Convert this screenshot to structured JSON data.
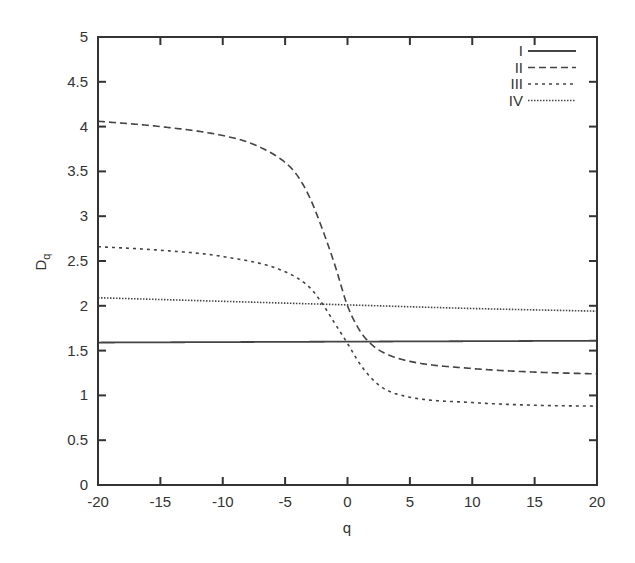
{
  "chart_data": {
    "type": "line",
    "title": "",
    "xlabel": "q",
    "ylabel": "D",
    "ylabel_subscript": "q",
    "xlim": [
      -20,
      20
    ],
    "ylim": [
      0,
      5
    ],
    "xticks": [
      "-20",
      "-15",
      "-10",
      "-5",
      "0",
      "5",
      "10",
      "15",
      "20"
    ],
    "yticks": [
      "0",
      "0.5",
      "1",
      "1.5",
      "2",
      "2.5",
      "3",
      "3.5",
      "4",
      "4.5",
      "5"
    ],
    "grid": false,
    "legend_position": "top-right",
    "series": [
      {
        "name": "I",
        "style": "solid",
        "x": [
          -20,
          20
        ],
        "values": [
          1.59,
          1.61
        ]
      },
      {
        "name": "II",
        "style": "dashed",
        "x": [
          -20,
          -15,
          -10,
          -7.5,
          -5,
          -4,
          -3,
          -2,
          -1,
          0,
          1,
          2,
          3,
          5,
          10,
          15,
          20
        ],
        "values": [
          4.06,
          4.0,
          3.9,
          3.8,
          3.6,
          3.45,
          3.2,
          2.85,
          2.45,
          2.0,
          1.72,
          1.56,
          1.47,
          1.38,
          1.3,
          1.26,
          1.24
        ]
      },
      {
        "name": "III",
        "style": "short-dashed",
        "x": [
          -20,
          -15,
          -10,
          -5,
          -3,
          -2,
          -1,
          0,
          1,
          2,
          3,
          5,
          10,
          15,
          20
        ],
        "values": [
          2.66,
          2.62,
          2.55,
          2.38,
          2.2,
          2.02,
          1.8,
          1.58,
          1.35,
          1.18,
          1.07,
          0.98,
          0.92,
          0.89,
          0.88
        ]
      },
      {
        "name": "IV",
        "style": "dotted",
        "x": [
          -20,
          -10,
          0,
          10,
          20
        ],
        "values": [
          2.09,
          2.05,
          2.01,
          1.97,
          1.94
        ]
      }
    ]
  }
}
